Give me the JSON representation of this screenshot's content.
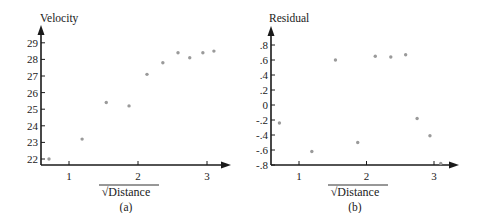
{
  "chart_data": [
    {
      "type": "scatter",
      "panel_label": "(a)",
      "title": "",
      "xlabel": "√Distance",
      "ylabel": "Velocity",
      "xlim": [
        0.6,
        3.3
      ],
      "ylim": [
        21.8,
        29.8
      ],
      "xticks": [
        1,
        2,
        3
      ],
      "yticks": [
        22,
        23,
        24,
        25,
        26,
        27,
        28,
        29
      ],
      "grid": false,
      "legend": null,
      "marker_color": "#9a9a9a",
      "x": [
        0.71,
        1.19,
        1.54,
        1.87,
        2.13,
        2.36,
        2.58,
        2.75,
        2.94,
        3.1
      ],
      "y": [
        22.0,
        23.2,
        25.4,
        25.2,
        27.1,
        27.8,
        28.4,
        28.1,
        28.4,
        28.5
      ]
    },
    {
      "type": "scatter",
      "panel_label": "(b)",
      "title": "",
      "xlabel": "√Distance",
      "ylabel": "Residual",
      "xlim": [
        0.6,
        3.3
      ],
      "ylim": [
        -0.8,
        1.0
      ],
      "xticks": [
        1,
        2,
        3
      ],
      "yticks": [
        ".8",
        ".6",
        ".4",
        ".2",
        "0",
        "-.2",
        "-.4",
        "-.6",
        "-.8"
      ],
      "ytick_values": [
        0.8,
        0.6,
        0.4,
        0.2,
        0,
        -0.2,
        -0.4,
        -0.6,
        -0.8
      ],
      "grid": false,
      "legend": null,
      "marker_color": "#9a9a9a",
      "x": [
        0.71,
        1.19,
        1.54,
        1.87,
        2.13,
        2.36,
        2.58,
        2.75,
        2.94,
        3.1
      ],
      "y": [
        -0.24,
        -0.62,
        0.6,
        -0.5,
        0.65,
        0.64,
        0.67,
        -0.18,
        -0.41,
        -0.78
      ]
    }
  ]
}
